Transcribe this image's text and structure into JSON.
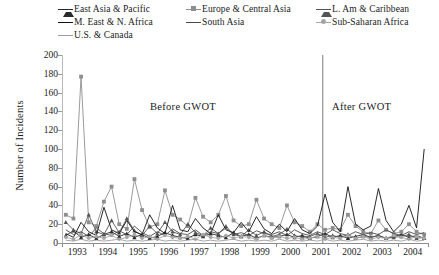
{
  "chart_data": {
    "type": "line",
    "title": "",
    "subtitle": "",
    "xlabel": "",
    "ylabel": "Number of Incidents",
    "ylim": [
      0,
      200
    ],
    "ytick_step": 20,
    "yticks": [
      "0",
      "20",
      "40",
      "60",
      "80",
      "100",
      "120",
      "140",
      "160",
      "180",
      "200"
    ],
    "xlim": [
      1993,
      2005
    ],
    "xticks": [
      "1993",
      "1994",
      "1995",
      "1996",
      "1997",
      "1998",
      "1999",
      "2000",
      "2001",
      "2002",
      "2003",
      "2004"
    ],
    "x_unit": "quarter",
    "points_per_year": 4,
    "grid": false,
    "legend_position": "top",
    "annotations": [
      {
        "text": "Before  GWOT",
        "x": 1997.0,
        "y": 148
      },
      {
        "text": "After  GWOT",
        "x": 2003.3,
        "y": 148
      }
    ],
    "vertical_marker": {
      "x": 2001.55,
      "label": "GWOT start",
      "color": "#7a7a7a"
    },
    "series": [
      {
        "name": "East Asia & Pacific",
        "marker": "triangle",
        "color": "#2a2a2a",
        "values": [
          8,
          13,
          6,
          9,
          5,
          9,
          12,
          7,
          10,
          6,
          9,
          5,
          7,
          11,
          8,
          6,
          5,
          9,
          7,
          10,
          8,
          6,
          11,
          7,
          9,
          5,
          8,
          6,
          7,
          9,
          6,
          8,
          5,
          7,
          10,
          6,
          8,
          5,
          7,
          9,
          6,
          8,
          5,
          7,
          9,
          6,
          8,
          5
        ]
      },
      {
        "name": "Europe & Central Asia",
        "marker": "square",
        "color": "#8e8e8e",
        "values": [
          30,
          26,
          177,
          22,
          18,
          44,
          60,
          20,
          15,
          68,
          35,
          17,
          20,
          56,
          30,
          25,
          18,
          48,
          28,
          22,
          30,
          50,
          24,
          18,
          20,
          46,
          26,
          20,
          16,
          40,
          22,
          18,
          12,
          20,
          14,
          16,
          14,
          30,
          18,
          12,
          10,
          24,
          14,
          10,
          12,
          20,
          12,
          9
        ]
      },
      {
        "name": "L. Am & Caribbean",
        "marker": "triangle",
        "color": "#555555",
        "values": [
          22,
          14,
          10,
          30,
          12,
          9,
          24,
          11,
          26,
          13,
          8,
          18,
          10,
          22,
          12,
          9,
          20,
          11,
          8,
          16,
          10,
          18,
          9,
          7,
          14,
          8,
          12,
          7,
          9,
          15,
          8,
          6,
          7,
          10,
          6,
          8,
          6,
          9,
          5,
          7,
          6,
          8,
          5,
          6,
          7,
          9,
          5,
          6
        ]
      },
      {
        "name": "M. East & N. Africa",
        "marker": "none",
        "color": "#111111",
        "values": [
          10,
          6,
          22,
          12,
          8,
          38,
          14,
          10,
          24,
          12,
          9,
          30,
          16,
          10,
          40,
          14,
          12,
          26,
          16,
          10,
          30,
          14,
          11,
          22,
          12,
          28,
          15,
          10,
          20,
          12,
          26,
          14,
          10,
          18,
          52,
          22,
          12,
          60,
          20,
          14,
          18,
          58,
          24,
          12,
          20,
          40,
          16,
          100
        ]
      },
      {
        "name": "South Asia",
        "marker": "none",
        "color": "#4a4a4a",
        "values": [
          14,
          9,
          12,
          7,
          16,
          10,
          8,
          13,
          9,
          18,
          11,
          7,
          12,
          8,
          15,
          10,
          9,
          14,
          8,
          12,
          10,
          16,
          9,
          11,
          8,
          13,
          10,
          9,
          12,
          8,
          14,
          10,
          8,
          12,
          9,
          14,
          10,
          8,
          12,
          9,
          11,
          9,
          14,
          10,
          8,
          12,
          9,
          11
        ]
      },
      {
        "name": "Sub-Saharan Africa",
        "marker": "circle",
        "color": "#a6a6a6",
        "values": [
          6,
          4,
          9,
          5,
          7,
          5,
          8,
          4,
          6,
          9,
          5,
          7,
          4,
          8,
          6,
          5,
          7,
          4,
          9,
          6,
          5,
          8,
          5,
          7,
          6,
          4,
          8,
          5,
          7,
          5,
          6,
          4,
          5,
          7,
          4,
          6,
          5,
          8,
          5,
          7,
          4,
          6,
          5,
          8,
          6,
          4,
          7,
          5
        ]
      },
      {
        "name": "U.S. & Canada",
        "marker": "none",
        "color": "#9c9c9c",
        "values": [
          3,
          2,
          4,
          2,
          3,
          2,
          3,
          4,
          2,
          3,
          2,
          3,
          4,
          2,
          3,
          2,
          3,
          4,
          2,
          3,
          2,
          3,
          4,
          2,
          3,
          2,
          3,
          2,
          4,
          2,
          3,
          2,
          3,
          2,
          4,
          2,
          3,
          2,
          3,
          4,
          2,
          3,
          2,
          3,
          2,
          4,
          2,
          3
        ]
      }
    ]
  },
  "legend": {
    "rows": [
      [
        {
          "label": "East Asia & Pacific",
          "marker": "triangle",
          "color": "#2a2a2a"
        },
        {
          "label": "Europe & Central Asia",
          "marker": "square",
          "color": "#8e8e8e"
        },
        {
          "label": "L. Am & Caribbean",
          "marker": "triangle",
          "color": "#555555"
        }
      ],
      [
        {
          "label": "M. East & N. Africa",
          "marker": "line",
          "color": "#111111"
        },
        {
          "label": "South Asia",
          "marker": "line",
          "color": "#4a4a4a"
        },
        {
          "label": "Sub-Saharan Africa",
          "marker": "circle",
          "color": "#a6a6a6"
        }
      ],
      [
        {
          "label": "U.S. & Canada",
          "marker": "line",
          "color": "#9c9c9c"
        }
      ]
    ]
  },
  "axis": {
    "y_title": "Number of Incidents"
  }
}
